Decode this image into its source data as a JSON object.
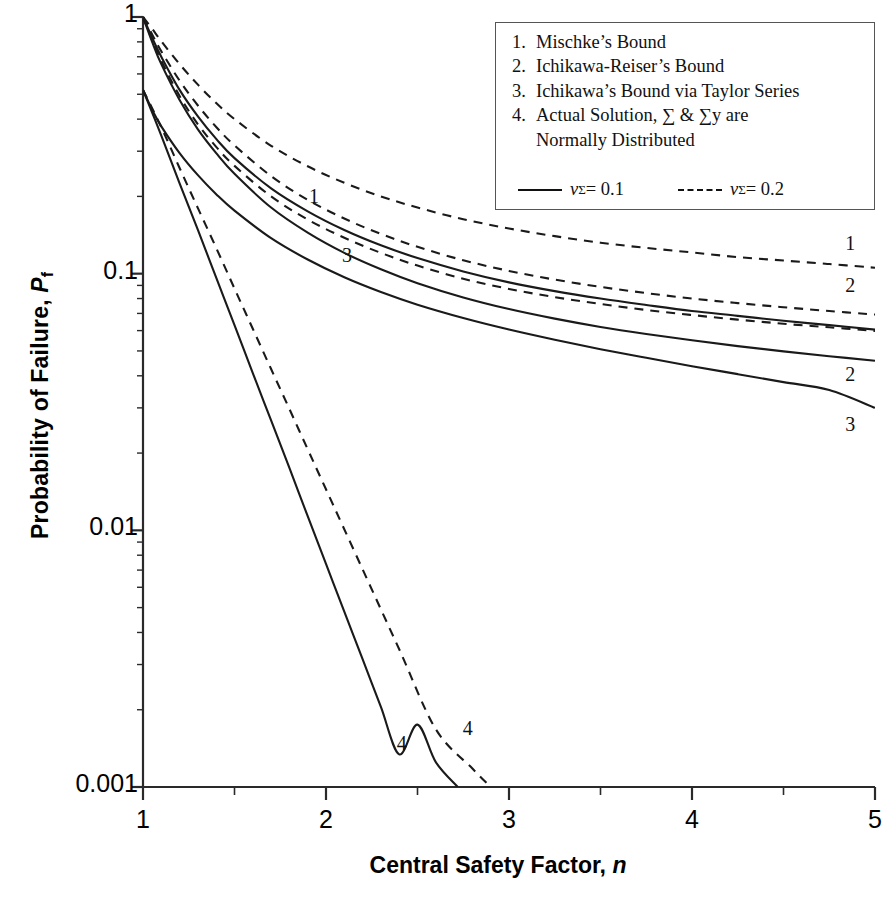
{
  "chart_data": {
    "type": "line",
    "title": "",
    "xlabel": "Central Safety Factor, n",
    "ylabel": "Probability of Failure, P_f",
    "xlim": [
      1,
      5
    ],
    "ylim": [
      0.001,
      1
    ],
    "yscale": "log",
    "xscale": "linear",
    "grid": false,
    "x_major_ticks": [
      "1",
      "2",
      "3",
      "4",
      "5"
    ],
    "x_minor_ticks": [
      1.5,
      2.5,
      3.5,
      4.5
    ],
    "y_major_ticks": [
      "1",
      "0.1",
      "0.01",
      "0.001"
    ],
    "legend_position": "top-right",
    "series": [
      {
        "name": "1",
        "legend_key": "Mischke's Bound",
        "style": "solid",
        "variation": "nu_sigma = 0.1",
        "x": [
          1.0,
          1.05,
          1.1,
          1.2,
          1.3,
          1.4,
          1.5,
          1.7,
          1.9,
          2.1,
          2.3,
          2.5,
          2.75,
          3.0,
          3.25,
          3.5,
          3.75,
          4.0,
          4.25,
          4.5,
          4.75,
          5.0
        ],
        "y": [
          1.0,
          0.83,
          0.7,
          0.52,
          0.41,
          0.335,
          0.282,
          0.215,
          0.175,
          0.148,
          0.129,
          0.115,
          0.102,
          0.0925,
          0.0855,
          0.08,
          0.0755,
          0.0715,
          0.0685,
          0.0655,
          0.063,
          0.0605
        ]
      },
      {
        "name": "2",
        "legend_key": "Ichikawa-Reiser's Bound",
        "style": "solid",
        "variation": "nu_sigma = 0.1",
        "x": [
          1.0,
          1.05,
          1.1,
          1.2,
          1.3,
          1.4,
          1.5,
          1.7,
          1.9,
          2.1,
          2.3,
          2.5,
          2.75,
          3.0,
          3.25,
          3.5,
          3.75,
          4.0,
          4.25,
          4.5,
          4.75,
          5.0
        ],
        "y": [
          1.0,
          0.8,
          0.655,
          0.475,
          0.365,
          0.295,
          0.245,
          0.181,
          0.1445,
          0.1205,
          0.104,
          0.0918,
          0.0808,
          0.0728,
          0.0668,
          0.062,
          0.0582,
          0.055,
          0.0522,
          0.0498,
          0.0477,
          0.0458
        ]
      },
      {
        "name": "3",
        "legend_key": "Ichikawa's Bound via Taylor Series",
        "style": "solid",
        "variation": "nu_sigma = 0.1",
        "x": [
          1.0,
          1.05,
          1.1,
          1.2,
          1.3,
          1.4,
          1.5,
          1.7,
          1.9,
          2.1,
          2.3,
          2.5,
          2.75,
          3.0,
          3.25,
          3.5,
          3.75,
          4.0,
          4.25,
          4.5,
          4.75,
          5.0
        ],
        "y": [
          0.52,
          0.435,
          0.375,
          0.295,
          0.242,
          0.204,
          0.176,
          0.1375,
          0.1135,
          0.0968,
          0.0848,
          0.0757,
          0.0672,
          0.0606,
          0.0553,
          0.0508,
          0.047,
          0.0436,
          0.0406,
          0.0378,
          0.0352,
          0.03
        ]
      },
      {
        "name": "1",
        "legend_key": "Mischke's Bound",
        "style": "dashed",
        "variation": "nu_sigma = 0.2",
        "x": [
          1.0,
          1.05,
          1.1,
          1.2,
          1.3,
          1.4,
          1.5,
          1.7,
          1.9,
          2.1,
          2.3,
          2.5,
          2.75,
          3.0,
          3.25,
          3.5,
          3.75,
          4.0,
          4.25,
          4.5,
          4.75,
          5.0
        ],
        "y": [
          1.0,
          0.9,
          0.805,
          0.655,
          0.545,
          0.462,
          0.4,
          0.315,
          0.262,
          0.226,
          0.2,
          0.181,
          0.163,
          0.15,
          0.14,
          0.132,
          0.126,
          0.121,
          0.116,
          0.1125,
          0.109,
          0.1055
        ]
      },
      {
        "name": "2",
        "legend_key": "Ichikawa-Reiser's Bound",
        "style": "dashed",
        "variation": "nu_sigma = 0.2",
        "x": [
          1.0,
          1.05,
          1.1,
          1.2,
          1.3,
          1.4,
          1.5,
          1.7,
          1.9,
          2.1,
          2.3,
          2.5,
          2.75,
          3.0,
          3.25,
          3.5,
          3.75,
          4.0,
          4.25,
          4.5,
          4.75,
          5.0
        ],
        "y": [
          1.0,
          0.855,
          0.735,
          0.565,
          0.452,
          0.373,
          0.316,
          0.24,
          0.194,
          0.164,
          0.1428,
          0.1272,
          0.1128,
          0.1025,
          0.0948,
          0.0888,
          0.084,
          0.08,
          0.0768,
          0.074,
          0.0715,
          0.0693
        ]
      },
      {
        "name": "3",
        "legend_key": "Ichikawa's Bound via Taylor Series",
        "style": "dashed",
        "variation": "nu_sigma = 0.2",
        "x": [
          1.0,
          1.05,
          1.1,
          1.2,
          1.3,
          1.4,
          1.5,
          1.7,
          1.9,
          2.1,
          2.3,
          2.5,
          2.75,
          3.0,
          3.25,
          3.5,
          3.75,
          4.0,
          4.25,
          4.5,
          4.75,
          5.0
        ],
        "y": [
          1.0,
          0.815,
          0.675,
          0.492,
          0.382,
          0.312,
          0.263,
          0.2,
          0.1625,
          0.138,
          0.1205,
          0.1075,
          0.0955,
          0.0872,
          0.081,
          0.0762,
          0.0722,
          0.069,
          0.0662,
          0.0638,
          0.0618,
          0.0598
        ]
      },
      {
        "name": "4",
        "legend_key": "Actual Solution",
        "style": "solid",
        "variation": "nu_sigma = 0.1",
        "x": [
          1.0,
          1.1,
          1.2,
          1.3,
          1.4,
          1.5,
          1.6,
          1.7,
          1.8,
          1.9,
          2.0,
          2.1,
          2.2,
          2.3,
          2.4,
          2.5,
          2.6,
          2.72
        ],
        "y": [
          0.52,
          0.345,
          0.225,
          0.148,
          0.0965,
          0.063,
          0.041,
          0.0268,
          0.0175,
          0.01135,
          0.0074,
          0.00482,
          0.00315,
          0.00205,
          0.00134,
          0.00175,
          0.00125,
          0.001
        ]
      },
      {
        "name": "4",
        "legend_key": "Actual Solution",
        "style": "dashed",
        "variation": "nu_sigma = 0.2",
        "x": [
          1.0,
          1.1,
          1.2,
          1.3,
          1.4,
          1.5,
          1.6,
          1.7,
          1.8,
          1.9,
          2.0,
          2.2,
          2.4,
          2.6,
          2.8,
          2.9
        ],
        "y": [
          0.52,
          0.372,
          0.258,
          0.18,
          0.126,
          0.0875,
          0.061,
          0.0425,
          0.0297,
          0.0207,
          0.01445,
          0.00705,
          0.00344,
          0.00168,
          0.00118,
          0.001
        ]
      }
    ],
    "annotations": [
      {
        "text": "1",
        "x": 1.94,
        "y": 0.195
      },
      {
        "text": "3",
        "x": 2.12,
        "y": 0.115
      },
      {
        "text": "1",
        "x": 4.87,
        "y": 0.128
      },
      {
        "text": "2",
        "x": 4.87,
        "y": 0.088
      },
      {
        "text": "2",
        "x": 4.87,
        "y": 0.0395
      },
      {
        "text": "3",
        "x": 4.87,
        "y": 0.0252
      },
      {
        "text": "4",
        "x": 2.42,
        "y": 0.00145
      },
      {
        "text": "4",
        "x": 2.78,
        "y": 0.00165
      }
    ]
  },
  "axis": {
    "y_title_main": "Probability of Failure, ",
    "y_title_symbol": "P",
    "y_title_sub": "f",
    "x_title_main": "Central Safety Factor, ",
    "x_title_symbol": "n",
    "y_labels": [
      "1",
      "0.1",
      "0.01",
      "0.001"
    ],
    "x_labels": [
      "1",
      "2",
      "3",
      "4",
      "5"
    ]
  },
  "legend": {
    "items": [
      {
        "num": "1.",
        "text": "Mischke’s Bound",
        "cont": ""
      },
      {
        "num": "2.",
        "text": "Ichikawa-Reiser’s Bound",
        "cont": ""
      },
      {
        "num": "3.",
        "text": "Ichikawa’s Bound via Taylor Series",
        "cont": ""
      },
      {
        "num": "4.",
        "text": "Actual Solution, ∑ & ∑y are",
        "cont": "Normally Distributed"
      }
    ],
    "keys": [
      {
        "style": "solid",
        "symbol": "ν",
        "sub": "Σ",
        "value": " = 0.1"
      },
      {
        "style": "dashed",
        "symbol": "ν",
        "sub": "Σ",
        "value": " = 0.2"
      }
    ]
  },
  "colors": {
    "line": "#1a1a1a",
    "axis": "#2a2a2a",
    "text": "#000000",
    "legend_border": "#555555",
    "background": "#ffffff"
  }
}
